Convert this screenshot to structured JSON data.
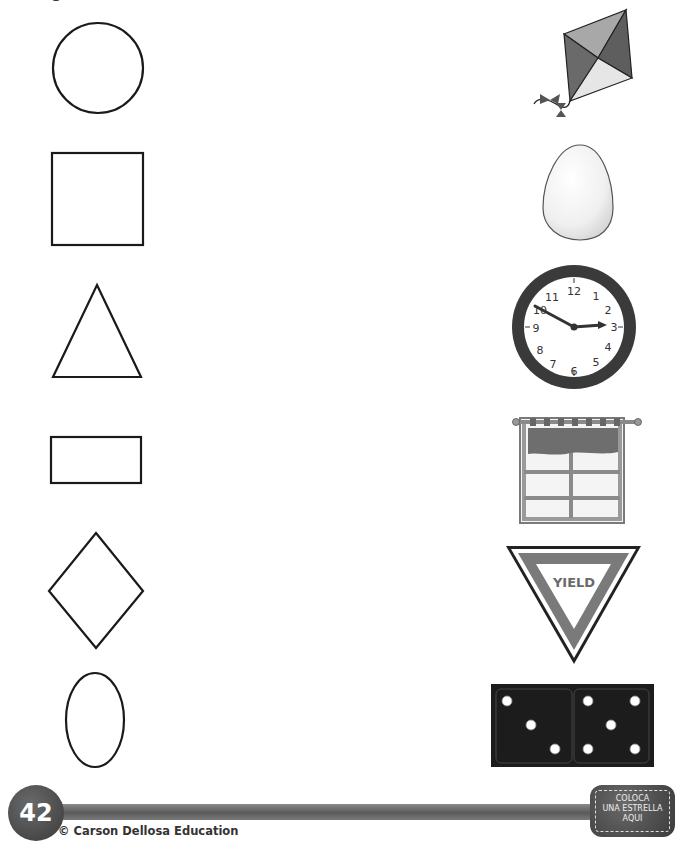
{
  "page": {
    "number": "42",
    "copyright": "© Carson Dellosa Education",
    "star_box": {
      "line1": "COLOCA",
      "line2": "UNA ESTRELLA",
      "line3": "AQUI"
    }
  },
  "left_shapes": [
    {
      "name": "circle"
    },
    {
      "name": "square"
    },
    {
      "name": "triangle"
    },
    {
      "name": "rectangle"
    },
    {
      "name": "diamond"
    },
    {
      "name": "oval"
    }
  ],
  "right_pictures": [
    {
      "name": "kite"
    },
    {
      "name": "egg"
    },
    {
      "name": "clock",
      "numbers": [
        "12",
        "1",
        "2",
        "3",
        "4",
        "5",
        "6",
        "7",
        "8",
        "9",
        "10",
        "11"
      ]
    },
    {
      "name": "window"
    },
    {
      "name": "yield-sign",
      "text": "YIELD"
    },
    {
      "name": "domino"
    }
  ],
  "colors": {
    "stroke": "#1a1a1a",
    "dark": "#3a3a3a",
    "mid": "#7a7a7a",
    "light": "#bdbdbd"
  }
}
